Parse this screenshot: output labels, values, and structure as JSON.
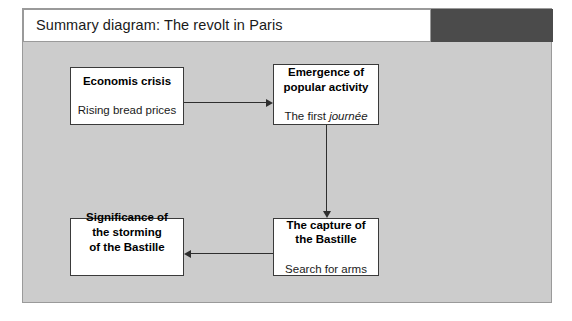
{
  "panel": {
    "title": "Summary diagram: The revolt in Paris",
    "background_color": "#cccccc",
    "border_color": "#9a9a9a",
    "title_block_color": "#4b4b4b"
  },
  "diagram": {
    "type": "flowchart",
    "node_fill_color": "#ffffff",
    "node_border_color": "#3a3a3a",
    "connector_color": "#2e2e2e",
    "nodes": [
      {
        "id": "economic-crisis",
        "heading": "Economis crisis",
        "subtext": "Rising bread prices",
        "subtext_italic": ""
      },
      {
        "id": "popular-activity",
        "heading": "Emergence of\npopular activity",
        "subtext": "The first ",
        "subtext_italic": "journée"
      },
      {
        "id": "capture-bastille",
        "heading": "The capture of\nthe Bastille",
        "subtext": "Search for arms",
        "subtext_italic": ""
      },
      {
        "id": "significance",
        "heading": "Significance of\nthe storming\nof the Bastille",
        "subtext": "",
        "subtext_italic": ""
      }
    ],
    "connectors": [
      {
        "id": "crisis-to-activity",
        "from": "economic-crisis",
        "to": "popular-activity",
        "direction": "right"
      },
      {
        "id": "activity-to-capture",
        "from": "popular-activity",
        "to": "capture-bastille",
        "direction": "down"
      },
      {
        "id": "capture-to-significance",
        "from": "capture-bastille",
        "to": "significance",
        "direction": "left"
      }
    ]
  }
}
